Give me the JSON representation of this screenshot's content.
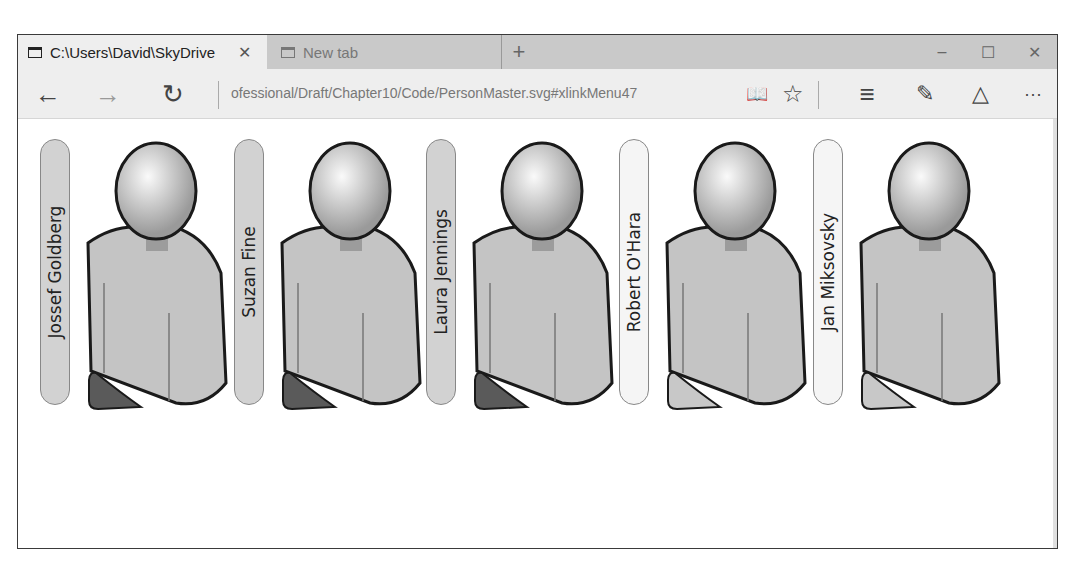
{
  "browser": {
    "tabs": [
      {
        "title": "C:\\Users\\David\\SkyDrive",
        "active": true,
        "close_icon": "close-icon"
      },
      {
        "title": "New tab",
        "active": false
      }
    ],
    "new_tab_label": "+",
    "window_controls": {
      "minimize": "–",
      "maximize": "☐",
      "close": "✕"
    },
    "nav": {
      "back": "←",
      "forward": "→",
      "refresh": "↻"
    },
    "address": "ofessional/Draft/Chapter10/Code/PersonMaster.svg#xlinkMenu47",
    "toolbar": {
      "reading_view": "📖",
      "favorite": "☆",
      "hub": "≡",
      "web_note": "✎",
      "share": "△",
      "more": "···"
    }
  },
  "people": [
    {
      "name": "Jossef Goldberg",
      "style": "dark",
      "foot_color": "#5a5a5a"
    },
    {
      "name": "Suzan Fine",
      "style": "dark",
      "foot_color": "#5a5a5a"
    },
    {
      "name": "Laura Jennings",
      "style": "dark",
      "foot_color": "#5a5a5a"
    },
    {
      "name": "Robert O'Hara",
      "style": "light",
      "foot_color": "#c8c8c8"
    },
    {
      "name": "Jan Miksovsky",
      "style": "light",
      "foot_color": "#c8c8c8"
    }
  ]
}
